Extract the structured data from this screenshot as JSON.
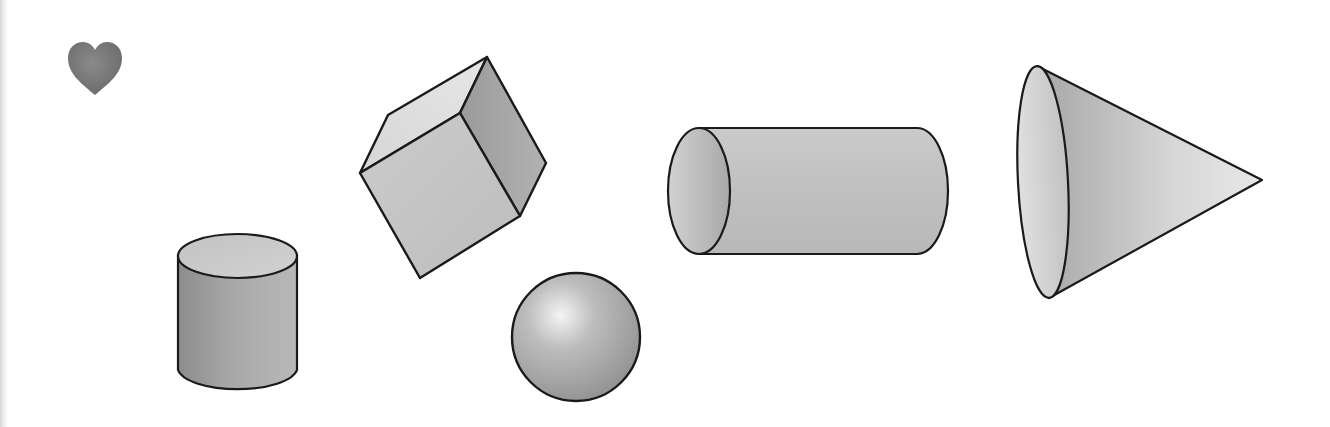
{
  "scene": {
    "title": "3D geometric solids",
    "background": "#ffffff",
    "stroke_color": "#1a1a1a",
    "shapes": [
      {
        "id": "heart",
        "label": "heart",
        "fill": "#7a7a7a"
      },
      {
        "id": "cylinder-upright",
        "label": "cylinder (upright)",
        "fill": "#9a9a9a"
      },
      {
        "id": "cube",
        "label": "cube",
        "fill": "#c8c8c8"
      },
      {
        "id": "sphere",
        "label": "sphere",
        "fill": "#b0b0b0"
      },
      {
        "id": "cylinder-horizontal",
        "label": "cylinder (horizontal)",
        "fill": "#c4c4c4"
      },
      {
        "id": "cone",
        "label": "cone",
        "fill": "#cfcfcf"
      }
    ]
  }
}
